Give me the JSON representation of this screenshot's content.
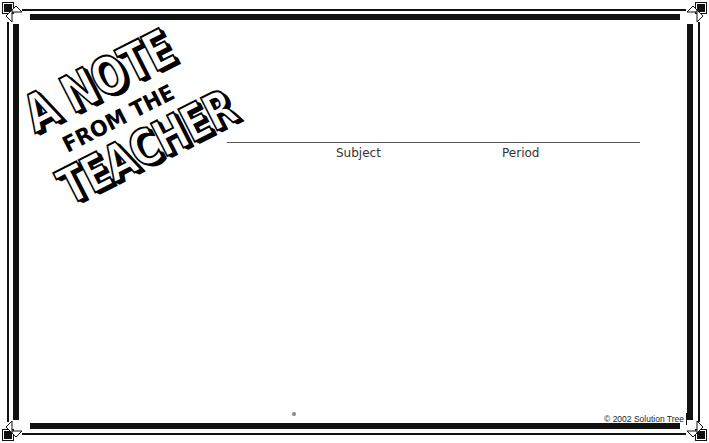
{
  "page": {
    "title_art": {
      "line1": "A NOTE",
      "line2": "FROM THE",
      "line3": "TEACHER"
    },
    "fields": [
      {
        "label": "Subject"
      },
      {
        "label": "Period"
      }
    ],
    "footer": {
      "copyright": "© 2002 Solution Tree"
    },
    "colors": {
      "border": "#111111",
      "background": "#ffffff",
      "rule": "#555555",
      "label_text": "#333333"
    }
  }
}
